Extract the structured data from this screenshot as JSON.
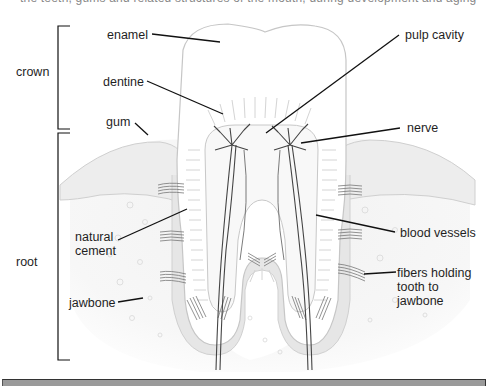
{
  "diagram": {
    "title_partial": "the teeth, gums and related structures of the mouth, during development and aging",
    "groups": [
      {
        "label": "crown"
      },
      {
        "label": "root"
      }
    ],
    "labels": {
      "enamel": "enamel",
      "dentine": "dentine",
      "gum": "gum",
      "natural_cement_1": "natural",
      "natural_cement_2": "cement",
      "jawbone": "jawbone",
      "pulp_cavity": "pulp cavity",
      "nerve": "nerve",
      "blood_vessels": "blood vessels",
      "fibers_1": "fibers holding",
      "fibers_2": "tooth to",
      "fibers_3": "jawbone"
    },
    "colors": {
      "leader_line": "#111111",
      "outline": "#bdbdbd",
      "gum_fill": "#ececec",
      "cement_fill": "#e2e2e2",
      "nerve": "#444444",
      "bottom_bar": "#9a9a9a"
    }
  }
}
